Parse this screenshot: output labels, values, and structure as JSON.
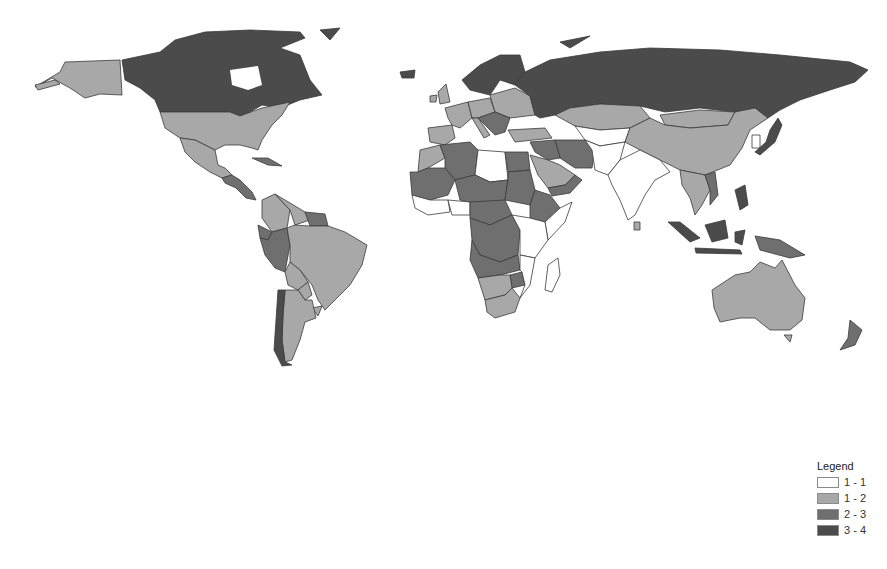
{
  "map": {
    "type": "choropleth-world",
    "classes": [
      {
        "id": "c1",
        "label": "1 - 1",
        "color": "#ffffff"
      },
      {
        "id": "c2",
        "label": "1 - 2",
        "color": "#a8a8a8"
      },
      {
        "id": "c3",
        "label": "2 - 3",
        "color": "#6f6f6f"
      },
      {
        "id": "c4",
        "label": "3 - 4",
        "color": "#4b4b4b"
      }
    ],
    "regions": [
      {
        "name": "Alaska (USA)",
        "class": "c2"
      },
      {
        "name": "Canada",
        "class": "c4"
      },
      {
        "name": "Greenland",
        "class": "c4"
      },
      {
        "name": "United States",
        "class": "c2"
      },
      {
        "name": "Mexico",
        "class": "c2"
      },
      {
        "name": "Central America",
        "class": "c3"
      },
      {
        "name": "Cuba",
        "class": "c3"
      },
      {
        "name": "Colombia",
        "class": "c2"
      },
      {
        "name": "Venezuela",
        "class": "c2"
      },
      {
        "name": "Guianas",
        "class": "c3"
      },
      {
        "name": "Ecuador",
        "class": "c3"
      },
      {
        "name": "Peru",
        "class": "c3"
      },
      {
        "name": "Brazil",
        "class": "c2"
      },
      {
        "name": "Bolivia",
        "class": "c2"
      },
      {
        "name": "Paraguay",
        "class": "c2"
      },
      {
        "name": "Uruguay",
        "class": "c2"
      },
      {
        "name": "Argentina",
        "class": "c2"
      },
      {
        "name": "Chile",
        "class": "c4"
      },
      {
        "name": "Iceland",
        "class": "c4"
      },
      {
        "name": "United Kingdom",
        "class": "c2"
      },
      {
        "name": "Ireland",
        "class": "c2"
      },
      {
        "name": "Scandinavia",
        "class": "c4"
      },
      {
        "name": "Western Europe",
        "class": "c2"
      },
      {
        "name": "Iberia",
        "class": "c2"
      },
      {
        "name": "Central Europe",
        "class": "c2"
      },
      {
        "name": "Eastern Europe",
        "class": "c2"
      },
      {
        "name": "Italy",
        "class": "c2"
      },
      {
        "name": "Balkans",
        "class": "c3"
      },
      {
        "name": "Turkey",
        "class": "c2"
      },
      {
        "name": "Russia",
        "class": "c4"
      },
      {
        "name": "Kazakhstan",
        "class": "c2"
      },
      {
        "name": "Central Asia",
        "class": "c1"
      },
      {
        "name": "Mongolia",
        "class": "c2"
      },
      {
        "name": "China",
        "class": "c2"
      },
      {
        "name": "Japan",
        "class": "c4"
      },
      {
        "name": "Korea",
        "class": "c1"
      },
      {
        "name": "Iran",
        "class": "c3"
      },
      {
        "name": "Iraq & Syria",
        "class": "c3"
      },
      {
        "name": "Saudi Arabia",
        "class": "c2"
      },
      {
        "name": "Yemen & Oman",
        "class": "c3"
      },
      {
        "name": "Afghanistan & Pakistan",
        "class": "c1"
      },
      {
        "name": "India",
        "class": "c1"
      },
      {
        "name": "Sri Lanka",
        "class": "c2"
      },
      {
        "name": "Southeast Asia mainland",
        "class": "c2"
      },
      {
        "name": "Vietnam",
        "class": "c3"
      },
      {
        "name": "Philippines",
        "class": "c4"
      },
      {
        "name": "Indonesia",
        "class": "c4"
      },
      {
        "name": "Papua New Guinea",
        "class": "c3"
      },
      {
        "name": "Australia",
        "class": "c2"
      },
      {
        "name": "New Zealand",
        "class": "c3"
      },
      {
        "name": "Morocco",
        "class": "c2"
      },
      {
        "name": "Algeria",
        "class": "c3"
      },
      {
        "name": "Libya",
        "class": "c1"
      },
      {
        "name": "Egypt",
        "class": "c3"
      },
      {
        "name": "Sahel West",
        "class": "c3"
      },
      {
        "name": "Niger & Chad",
        "class": "c3"
      },
      {
        "name": "Sudan",
        "class": "c3"
      },
      {
        "name": "West Africa coast",
        "class": "c1"
      },
      {
        "name": "Nigeria",
        "class": "c1"
      },
      {
        "name": "Ethiopia",
        "class": "c3"
      },
      {
        "name": "Somalia & Horn",
        "class": "c1"
      },
      {
        "name": "Central Africa",
        "class": "c3"
      },
      {
        "name": "DR Congo",
        "class": "c3"
      },
      {
        "name": "East Africa",
        "class": "c1"
      },
      {
        "name": "Angola & Zambia",
        "class": "c3"
      },
      {
        "name": "Mozambique",
        "class": "c1"
      },
      {
        "name": "Zimbabwe",
        "class": "c3"
      },
      {
        "name": "Namibia & Botswana",
        "class": "c2"
      },
      {
        "name": "South Africa",
        "class": "c2"
      },
      {
        "name": "Madagascar",
        "class": "c1"
      }
    ]
  },
  "legend": {
    "title": "Legend",
    "items": [
      {
        "label": "1 - 1",
        "color": "#ffffff"
      },
      {
        "label": "1 - 2",
        "color": "#a8a8a8"
      },
      {
        "label": "2 - 3",
        "color": "#6f6f6f"
      },
      {
        "label": "3 - 4",
        "color": "#4b4b4b"
      }
    ]
  }
}
